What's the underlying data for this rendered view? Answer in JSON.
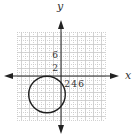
{
  "graph": {
    "x_axis_label": "x",
    "y_axis_label": "y",
    "y_tick_labels": [
      "6",
      "2"
    ],
    "x_tick_labels": [
      "2",
      "4",
      "6"
    ],
    "x_range": [
      -11,
      11
    ],
    "y_range": [
      -11,
      11
    ],
    "circle": {
      "center": [
        -3.5,
        -4.6
      ],
      "radius": 4.6
    }
  },
  "colors": {
    "axis": "#222222",
    "grid": "#c8c8c8",
    "curve": "#1e1e1e"
  }
}
